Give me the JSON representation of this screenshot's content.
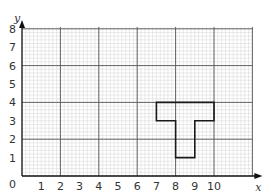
{
  "chart_data": {
    "type": "grid-diagram",
    "title": "",
    "xlabel": "x",
    "ylabel": "y",
    "x_ticks": [
      "1",
      "2",
      "3",
      "4",
      "5",
      "6",
      "7",
      "8",
      "9",
      "10"
    ],
    "y_ticks": [
      "1",
      "2",
      "3",
      "4",
      "5",
      "6",
      "7",
      "8"
    ],
    "origin_label": "0",
    "xlim": [
      0,
      12
    ],
    "ylim": [
      0,
      8
    ],
    "grid": true,
    "minor_grid_per_unit": 5,
    "shape": {
      "name": "T-shape",
      "vertices": [
        [
          7,
          4
        ],
        [
          10,
          4
        ],
        [
          10,
          3
        ],
        [
          9,
          3
        ],
        [
          9,
          1
        ],
        [
          8,
          1
        ],
        [
          8,
          3
        ],
        [
          7,
          3
        ]
      ]
    }
  },
  "colors": {
    "minor_grid": "#d4d4d4",
    "major_grid": "#555555",
    "axis": "#111111",
    "shape": "#1a1a1a"
  }
}
